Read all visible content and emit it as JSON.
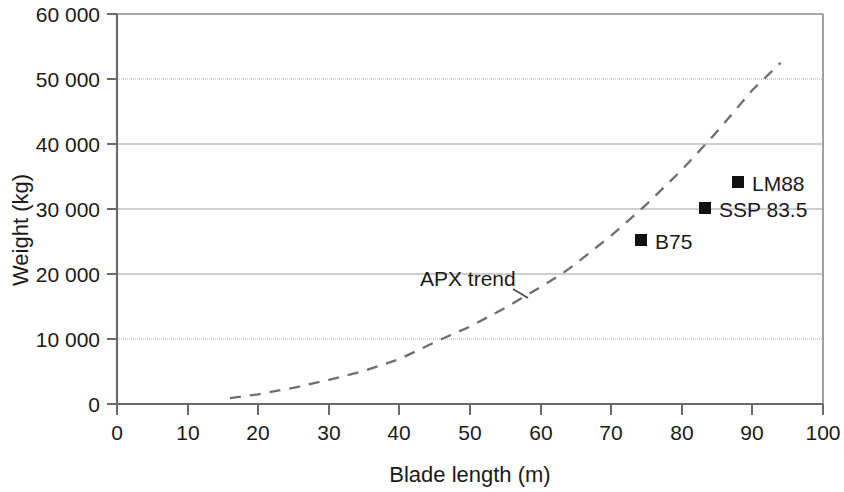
{
  "chart_data": {
    "type": "scatter",
    "title": "",
    "xlabel": "Blade length (m)",
    "ylabel": "Weight (kg)",
    "xlim": [
      0,
      100
    ],
    "ylim": [
      0,
      60000
    ],
    "grid": true,
    "legend": "none",
    "xticks": [
      "0",
      "10",
      "20",
      "30",
      "40",
      "50",
      "60",
      "70",
      "80",
      "90",
      "100"
    ],
    "xtick_values": [
      0,
      10,
      20,
      30,
      40,
      50,
      60,
      70,
      80,
      90,
      100
    ],
    "yticks": [
      "0",
      "10 000",
      "20 000",
      "30 000",
      "40 000",
      "50 000",
      "60 000"
    ],
    "ytick_values": [
      0,
      10000,
      20000,
      30000,
      40000,
      50000,
      60000
    ],
    "series": [
      {
        "name": "Blade data points",
        "type": "scatter",
        "marker": "square",
        "color": "#111111",
        "points": [
          {
            "label": "B75",
            "x": 75,
            "y": 25200
          },
          {
            "label": "SSP 83.5",
            "x": 83.5,
            "y": 30100
          },
          {
            "label": "LM88",
            "x": 88,
            "y": 34400
          }
        ]
      },
      {
        "name": "APX trend",
        "type": "line",
        "style": "dashed",
        "color": "#6f6f6f",
        "x": [
          16,
          20,
          25,
          30,
          35,
          40,
          46,
          50,
          55,
          60,
          63,
          65,
          70,
          75,
          80,
          85,
          90,
          94
        ],
        "y": [
          900,
          1500,
          2500,
          3700,
          5100,
          6900,
          10000,
          11900,
          14800,
          18000,
          20000,
          21600,
          25900,
          30700,
          36000,
          41900,
          48300,
          52500
        ]
      }
    ],
    "annotations": [
      {
        "text": "APX trend",
        "x": 45,
        "y": 20800
      }
    ]
  },
  "axes": {
    "x_title": "Blade length (m)",
    "y_title": "Weight (kg)"
  },
  "points": {
    "b75": {
      "label": "B75"
    },
    "ssp": {
      "label": "SSP 83.5"
    },
    "lm88": {
      "label": "LM88"
    }
  },
  "annotation": {
    "apx_trend": "APX trend"
  },
  "colors": {
    "marker": "#111111",
    "trend": "#6f6f6f",
    "grid": "#9a9a9a",
    "axis": "#6a6a6a",
    "text": "#1a1a1a"
  }
}
